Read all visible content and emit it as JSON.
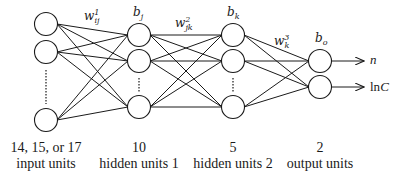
{
  "diagram": {
    "type": "feed-forward neural network",
    "colors": {
      "line": "#1a1a1a",
      "background": "#ffffff"
    },
    "layers": [
      {
        "id": "input",
        "count_label": "14, 15, or 17",
        "name_label": "input units",
        "bias": ""
      },
      {
        "id": "hidden1",
        "count_label": "10",
        "name_label": "hidden units 1",
        "bias": {
          "base": "b",
          "sub": "j"
        }
      },
      {
        "id": "hidden2",
        "count_label": "5",
        "name_label": "hidden units 2",
        "bias": {
          "base": "b",
          "sub": "k"
        }
      },
      {
        "id": "output",
        "count_label": "2",
        "name_label": "output units",
        "bias": {
          "base": "b",
          "sub": "o"
        }
      }
    ],
    "weights": [
      {
        "base": "w",
        "sub": "ij",
        "sup": "1"
      },
      {
        "base": "w",
        "sub": "jk",
        "sup": "2"
      },
      {
        "base": "w",
        "sub": "k",
        "sup": "3"
      }
    ],
    "outputs": [
      {
        "label": "n",
        "italic": true
      },
      {
        "label_prefix": "ln",
        "label_var": "C"
      }
    ]
  }
}
